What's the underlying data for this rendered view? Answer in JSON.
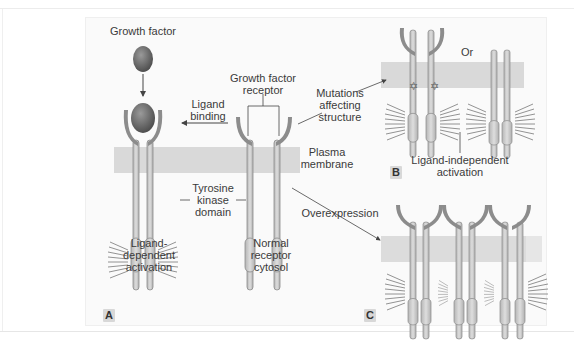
{
  "figure": {
    "panels": [
      {
        "id": "A",
        "label": "A"
      },
      {
        "id": "B",
        "label": "B"
      },
      {
        "id": "C",
        "label": "C"
      }
    ],
    "labels": {
      "growth_factor": "Growth factor",
      "growth_factor_receptor_line1": "Growth factor",
      "growth_factor_receptor_line2": "receptor",
      "ligand_binding_line1": "Ligand",
      "ligand_binding_line2": "binding",
      "mutations_line1": "Mutations",
      "mutations_line2": "affecting",
      "mutations_line3": "structure",
      "or": "Or",
      "plasma_membrane_line1": "Plasma",
      "plasma_membrane_line2": "membrane",
      "ligand_independent_line1": "Ligand-independent",
      "ligand_independent_line2": "activation",
      "tyrosine_kinase_line1": "Tyrosine",
      "tyrosine_kinase_line2": "kinase",
      "tyrosine_kinase_line3": "domain",
      "overexpression": "Overexpression",
      "ligand_dependent_line1": "Ligand-",
      "ligand_dependent_line2": "dependent",
      "ligand_dependent_line3": "activation",
      "normal_receptor_line1": "Normal",
      "normal_receptor_line2": "receptor",
      "normal_receptor_line3": "cytosol"
    },
    "colors": {
      "membrane": "#d9d9d9",
      "receptor_stalk": "#c9c9c9",
      "receptor_outline": "#8a8a8a",
      "ligand_binding_arm": "#8c8c8c",
      "growth_factor_ball": "#6e6e6e",
      "panel_background": "#fafafa",
      "text": "#3a3a3a"
    }
  }
}
